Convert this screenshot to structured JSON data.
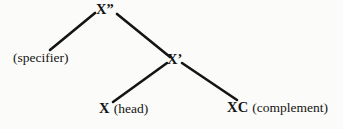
{
  "diagram": {
    "type": "syntax-tree",
    "background_color": "#fbfbf9",
    "line_color": "#141414",
    "text_color": "#141414",
    "nodes": {
      "maximal_projection": {
        "base": "X",
        "bar_marker": "”",
        "full_label": "X”"
      },
      "specifier": {
        "label": "(specifier)"
      },
      "intermediate_projection": {
        "base": "X",
        "bar_marker": "’",
        "full_label": "X’"
      },
      "head": {
        "category": "X",
        "gloss": "(head)"
      },
      "complement": {
        "category": "XC",
        "gloss": "(complement)"
      }
    },
    "branches": [
      {
        "name": "xmax-to-specifier",
        "from": "X”",
        "to": "(specifier)"
      },
      {
        "name": "xmax-to-xbar",
        "from": "X”",
        "to": "X’"
      },
      {
        "name": "xbar-to-head",
        "from": "X’",
        "to": "X"
      },
      {
        "name": "xbar-to-complement",
        "from": "X’",
        "to": "XC"
      }
    ]
  }
}
